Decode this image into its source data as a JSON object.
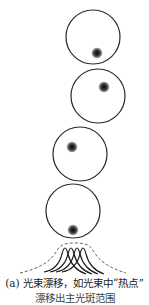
{
  "figure": {
    "panel_label": "(a)",
    "caption_line1": "(a) 光束漂移，如光束中“热点”",
    "caption_line2": "漂移出主光斑范围",
    "colors": {
      "circle_stroke": "#2a2a2a",
      "spot_core": "#111111",
      "curve_stroke": "#1a1a1a",
      "envelope_dashed": "#555555"
    },
    "beam_frames": [
      {
        "cx": 93,
        "cy": 37,
        "r": 27,
        "spot_x": 97,
        "spot_y": 53
      },
      {
        "cx": 98,
        "cy": 96,
        "r": 27,
        "spot_x": 104,
        "spot_y": 87
      },
      {
        "cx": 80,
        "cy": 154,
        "r": 27,
        "spot_x": 72,
        "spot_y": 147
      },
      {
        "cx": 73,
        "cy": 211,
        "r": 27,
        "spot_x": 73,
        "spot_y": 230
      }
    ],
    "profile_curves_count": 4,
    "envelope_style": "dashed"
  }
}
